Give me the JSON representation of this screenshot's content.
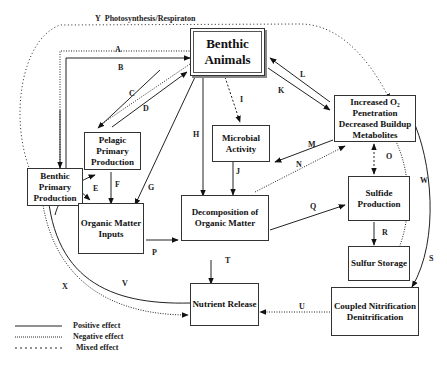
{
  "title_arrow": {
    "letter": "Y",
    "label": "Photosynthesis/Respiraton"
  },
  "boxes": {
    "benthic_animals": "Benthic Animals",
    "benthic_primary": "Benthic Primary Production",
    "pelagic_primary": "Pelagic Primary Production",
    "microbial": "Microbial Activity",
    "o2": "Increased O₂ Penetration Decreased Buildup Metabolites",
    "organic_inputs": "Organic Matter Inputs",
    "decomposition": "Decomposition of Organic Matter",
    "sulfide": "Sulfide Production",
    "sulfur": "Sulfur Storage",
    "nutrient": "Nutrient Release",
    "coupled": "Coupled Nitrification Denitrification"
  },
  "arrow_labels": {
    "A": "A",
    "B": "B",
    "C": "C",
    "D": "D",
    "E": "E",
    "F": "F",
    "G": "G",
    "H": "H",
    "I": "I",
    "J": "J",
    "K": "K",
    "L": "L",
    "M": "M",
    "N": "N",
    "O": "O",
    "P": "P",
    "Q": "Q",
    "R": "R",
    "S": "S",
    "T": "T",
    "U": "U",
    "V": "V",
    "W": "W",
    "X": "X"
  },
  "legend": {
    "positive": "Positive effect",
    "negative": "Negative effect",
    "mixed": "Mixed effect"
  },
  "colors": {
    "line": "#222222",
    "dotted": "#555555"
  }
}
